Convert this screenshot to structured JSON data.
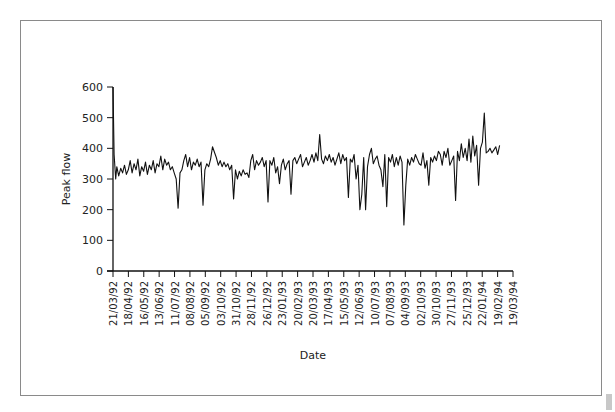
{
  "chart_data": {
    "type": "line",
    "title": "",
    "xlabel": "Date",
    "ylabel": "Peak flow",
    "ylim": [
      0,
      600
    ],
    "yticks": [
      0,
      100,
      200,
      300,
      400,
      500,
      600
    ],
    "grid": false,
    "legend": null,
    "x_tick_labels": [
      "21/03/92",
      "18/04/92",
      "16/05/92",
      "13/06/92",
      "11/07/92",
      "08/08/92",
      "05/09/92",
      "03/10/92",
      "31/10/92",
      "28/11/92",
      "26/12/92",
      "23/01/93",
      "20/02/93",
      "20/03/93",
      "17/04/93",
      "15/05/93",
      "12/06/93",
      "10/07/93",
      "07/08/93",
      "04/09/93",
      "02/10/93",
      "30/10/93",
      "27/11/93",
      "25/12/93",
      "22/01/94",
      "19/02/94",
      "19/03/94"
    ],
    "series": [
      {
        "name": "Peak flow",
        "color": "#111111",
        "x_weeks": [
          0,
          0.3,
          0.7,
          1,
          1.5,
          2,
          2.5,
          3,
          3.5,
          4,
          4.5,
          5,
          5.5,
          6,
          6.5,
          7,
          7.5,
          8,
          8.5,
          9,
          9.5,
          10,
          10.5,
          11,
          11.5,
          12,
          12.5,
          13,
          13.5,
          14,
          14.5,
          15,
          15.5,
          16,
          16.5,
          17,
          17.5,
          18,
          18.5,
          19,
          19.5,
          20,
          20.5,
          21,
          21.5,
          22,
          22.5,
          23,
          23.5,
          24,
          24.5,
          25,
          25.5,
          26,
          27,
          27.5,
          28,
          28.5,
          29,
          29.5,
          30,
          30.5,
          31,
          31.5,
          32,
          32.5,
          33,
          33.5,
          34,
          34.5,
          35,
          35.5,
          36,
          36.5,
          37,
          37.5,
          38,
          38.5,
          39,
          39.5,
          40,
          40.5,
          41,
          41.5,
          42,
          42.5,
          43,
          43.5,
          44,
          44.5,
          45,
          45.5,
          46,
          46.5,
          47,
          47.5,
          48,
          48.5,
          49,
          49.5,
          50,
          50.5,
          51,
          51.5,
          52,
          52.5,
          53,
          53.5,
          54,
          54.5,
          55,
          55.5,
          56,
          56.5,
          57,
          57.5,
          58,
          58.5,
          59,
          59.5,
          60,
          60.5,
          61,
          61.5,
          62,
          62.5,
          63,
          63.5,
          64,
          64.5,
          65,
          65.5,
          66,
          66.5,
          67,
          67.5,
          68,
          68.5,
          69,
          69.5,
          70,
          70.5,
          71,
          71.5,
          72,
          72.5,
          73,
          73.5,
          74,
          74.5,
          75,
          75.5,
          76,
          76.5,
          77,
          77.5,
          78,
          78.5,
          79,
          79.5,
          80,
          80.5,
          81,
          81.5,
          82,
          82.5,
          83,
          83.5,
          84,
          84.5,
          85,
          85.5,
          86,
          86.5,
          87,
          87.5,
          88,
          88.5,
          89,
          89.5,
          90,
          90.5,
          91,
          91.5,
          92,
          92.5,
          93,
          93.5,
          94,
          94.5,
          95,
          95.5,
          96,
          96.5,
          97,
          97.5,
          98,
          98.5,
          99,
          99.5,
          100,
          100.5,
          101,
          101.5,
          102,
          102.5,
          103,
          103.5,
          104
        ],
        "values": [
          600,
          380,
          300,
          340,
          310,
          335,
          320,
          345,
          315,
          330,
          360,
          320,
          350,
          330,
          365,
          310,
          340,
          325,
          355,
          315,
          345,
          330,
          360,
          320,
          350,
          340,
          375,
          330,
          365,
          345,
          355,
          330,
          340,
          320,
          300,
          205,
          320,
          330,
          360,
          380,
          340,
          370,
          330,
          355,
          345,
          365,
          340,
          355,
          215,
          330,
          350,
          340,
          365,
          405,
          370,
          345,
          360,
          340,
          355,
          340,
          350,
          330,
          345,
          235,
          330,
          300,
          325,
          310,
          330,
          315,
          320,
          305,
          360,
          380,
          330,
          360,
          345,
          355,
          370,
          340,
          360,
          225,
          360,
          345,
          370,
          320,
          340,
          285,
          345,
          365,
          330,
          350,
          360,
          250,
          360,
          370,
          350,
          365,
          380,
          340,
          355,
          370,
          345,
          360,
          380,
          355,
          385,
          360,
          445,
          365,
          350,
          375,
          360,
          380,
          355,
          370,
          345,
          365,
          385,
          350,
          380,
          360,
          370,
          240,
          365,
          355,
          380,
          300,
          345,
          200,
          250,
          370,
          200,
          340,
          380,
          400,
          350,
          365,
          375,
          345,
          330,
          275,
          380,
          210,
          370,
          355,
          380,
          340,
          370,
          345,
          375,
          355,
          150,
          280,
          365,
          345,
          370,
          355,
          380,
          365,
          350,
          345,
          385,
          335,
          360,
          280,
          370,
          355,
          375,
          360,
          390,
          380,
          345,
          390,
          370,
          400,
          345,
          360,
          375,
          230,
          390,
          360,
          415,
          370,
          400,
          360,
          430,
          355,
          440,
          375,
          410,
          280,
          400,
          420,
          515,
          385,
          390,
          400,
          385,
          395,
          405,
          380,
          410
        ]
      }
    ],
    "notable_points": [
      {
        "date": "21/03/92",
        "value": 600,
        "note": "initial spike"
      },
      {
        "date": "~20/07/92",
        "value": 205,
        "note": "dip"
      },
      {
        "date": "~27/09/92",
        "value": 215,
        "note": "dip"
      },
      {
        "date": "~14/04/93",
        "value": 445,
        "note": "peak"
      },
      {
        "date": "~28/09/93",
        "value": 150,
        "note": "lowest dip"
      },
      {
        "date": "~10/02/94",
        "value": 515,
        "note": "highest peak after start"
      }
    ]
  }
}
